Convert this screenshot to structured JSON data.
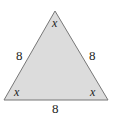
{
  "figure": {
    "shape": "equilateral-triangle",
    "fill_color": "#dcdcdc",
    "stroke_color": "#777777",
    "angles": {
      "top": "x",
      "bottom_left": "x",
      "bottom_right": "x"
    },
    "sides": {
      "left": "8",
      "right": "8",
      "bottom": "8"
    }
  }
}
